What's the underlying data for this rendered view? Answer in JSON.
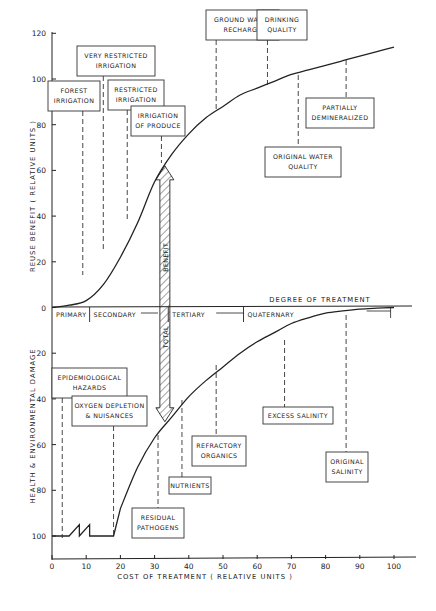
{
  "chart_data": {
    "type": "line",
    "title": "",
    "xlabel": "COST OF TREATMENT  ( RELATIVE UNITS )",
    "ylabel_upper": "REUSE  BENEFIT  ( RELATIVE  UNITS )",
    "ylabel_lower": "HEALTH  &  ENVIRONMENTAL  DAMAGE",
    "center_axis_label": "DEGREE  OF  TREATMENT",
    "xlim": [
      0,
      107
    ],
    "ylim_upper": [
      0,
      120
    ],
    "ylim_lower": [
      0,
      100
    ],
    "x_ticks": [
      "0",
      "10",
      "20",
      "30",
      "40",
      "50",
      "60",
      "70",
      "80",
      "90",
      "100"
    ],
    "y_ticks_upper": [
      "0",
      "20",
      "40",
      "60",
      "80",
      "100",
      "120"
    ],
    "y_ticks_lower": [
      "20",
      "40",
      "60",
      "80",
      "100"
    ],
    "grid": false,
    "series": [
      {
        "name": "Reuse Benefit",
        "x": [
          0,
          5,
          10,
          15,
          20,
          25,
          30,
          35,
          40,
          45,
          50,
          55,
          60,
          65,
          70,
          75,
          80,
          85,
          90,
          95,
          100
        ],
        "y": [
          0,
          1,
          3,
          10,
          22,
          37,
          55,
          67,
          76,
          83,
          88,
          93,
          96,
          99,
          102,
          104,
          106,
          108,
          110,
          112,
          114
        ]
      },
      {
        "name": "Health & Environmental Damage",
        "x": [
          0,
          3,
          5,
          8,
          8,
          11,
          11,
          18,
          20,
          25,
          30,
          35,
          40,
          45,
          50,
          55,
          60,
          65,
          70,
          75,
          80,
          85,
          90,
          95,
          100
        ],
        "y": [
          100,
          100,
          100,
          95,
          100,
          95,
          100,
          100,
          88,
          70,
          57,
          48,
          39,
          32,
          26,
          20,
          15,
          11,
          7,
          4.5,
          2.5,
          1.5,
          0.7,
          0.3,
          0
        ]
      }
    ],
    "treatment_stages": [
      {
        "label": "PRIMARY",
        "x_start": 0,
        "x_end": 11
      },
      {
        "label": "SECONDARY",
        "x_start": 11,
        "x_end": 26
      },
      {
        "label": "TERTIARY",
        "x_start": 34,
        "x_end": 56
      },
      {
        "label": "QUATERNARY",
        "x_start": 56,
        "x_end": 99
      }
    ],
    "annotations_upper": [
      {
        "label": "FOREST IRRIGATION",
        "lines": [
          "FOREST",
          "IRRIGATION"
        ],
        "x": 9
      },
      {
        "label": "VERY RESTRICTED IRRIGATION",
        "lines": [
          "VERY RESTRICTED",
          "IRRIGATION"
        ],
        "x": 15
      },
      {
        "label": "RESTRICTED IRRIGATION",
        "lines": [
          "RESTRICTED",
          "IRRIGATION"
        ],
        "x": 22
      },
      {
        "label": "IRRIGATION OF PRODUCE",
        "lines": [
          "IRRIGATION",
          "OF PRODUCE"
        ],
        "x": 32
      },
      {
        "label": "GROUND WATER RECHARGE",
        "lines": [
          "GROUND WATER",
          "RECHARGE"
        ],
        "x": 48
      },
      {
        "label": "DRINKING QUALITY",
        "lines": [
          "DRINKING",
          "QUALITY"
        ],
        "x": 63
      },
      {
        "label": "ORIGINAL WATER QUALITY",
        "lines": [
          "ORIGINAL  WATER",
          "QUALITY"
        ],
        "x": 72
      },
      {
        "label": "PARTIALLY DEMINERALIZED",
        "lines": [
          "PARTIALLY",
          "DEMINERALIZED"
        ],
        "x": 86
      }
    ],
    "annotations_lower": [
      {
        "label": "EPIDEMIOLOGICAL HAZARDS",
        "lines": [
          "EPIDEMIOLOGICAL",
          "HAZARDS"
        ],
        "x": 3
      },
      {
        "label": "OXYGEN DEPLETION & NUISANCES",
        "lines": [
          "OXYGEN DEPLETION",
          "& NUISANCES"
        ],
        "x": 18
      },
      {
        "label": "RESIDUAL PATHOGENS",
        "lines": [
          "RESIDUAL",
          "PATHOGENS"
        ],
        "x": 31
      },
      {
        "label": "NUTRIENTS",
        "lines": [
          "NUTRIENTS"
        ],
        "x": 38
      },
      {
        "label": "REFRACTORY ORGANICS",
        "lines": [
          "REFRACTORY",
          "ORGANICS"
        ],
        "x": 48
      },
      {
        "label": "EXCESS SALINITY",
        "lines": [
          "EXCESS SALINITY"
        ],
        "x": 68
      },
      {
        "label": "ORIGINAL SALINITY",
        "lines": [
          "ORIGINAL",
          "SALINITY"
        ],
        "x": 86
      }
    ],
    "total_benefit_arrow": {
      "label_upper": "BENEFIT",
      "label_lower": "TOTAL",
      "x": 33,
      "y_top_benefit": 62,
      "y_bottom_damage": 50
    }
  }
}
